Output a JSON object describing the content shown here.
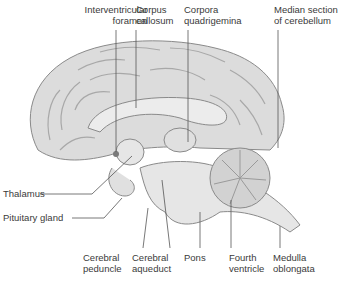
{
  "diagram": {
    "labels": {
      "interventricular_foramen": [
        "Interventricular",
        "foramen"
      ],
      "corpus_callosum": [
        "Corpus",
        "callosum"
      ],
      "corpora_quadrigemina": [
        "Corpora",
        "quadrigemina"
      ],
      "median_section_cerebellum": [
        "Median section",
        "of cerebellum"
      ],
      "thalamus": [
        "Thalamus"
      ],
      "pituitary_gland": [
        "Pituitary gland"
      ],
      "cerebral_peduncle": [
        "Cerebral",
        "peduncle"
      ],
      "cerebral_aqueduct": [
        "Cerebral",
        "aqueduct"
      ],
      "pons": [
        "Pons"
      ],
      "fourth_ventricle": [
        "Fourth",
        "ventricle"
      ],
      "medulla_oblongata": [
        "Medulla",
        "oblongata"
      ]
    },
    "colors": {
      "tissue_fill": "#dcdcdc",
      "tissue_light": "#ececec",
      "outline": "#8a8a8a",
      "leader_line": "#555555",
      "text": "#3a3a3a"
    }
  }
}
